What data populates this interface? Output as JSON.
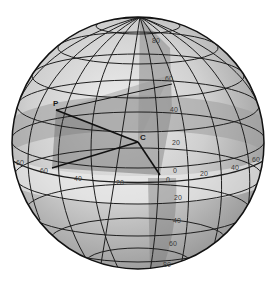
{
  "diagram": {
    "points": {
      "P": {
        "label": "P"
      },
      "C": {
        "label": "C"
      }
    },
    "latitude_labels_north": [
      "20",
      "40",
      "60",
      "80"
    ],
    "latitude_labels_south": [
      "20",
      "40",
      "60",
      "80"
    ],
    "longitude_labels_west": [
      "20",
      "40",
      "60",
      "60"
    ],
    "longitude_labels_east": [
      "20",
      "40",
      "60"
    ],
    "origin_labels": [
      "0",
      "0"
    ],
    "colors": {
      "sphere_light": "#e6e6e6",
      "sphere_mid": "#c4c4c4",
      "sphere_dark": "#8f8f8f",
      "band_shade": "#a8a8a8",
      "wedge_shade": "#7c7c7c",
      "grid_line": "#1e1e1e",
      "outline": "#111111"
    }
  }
}
